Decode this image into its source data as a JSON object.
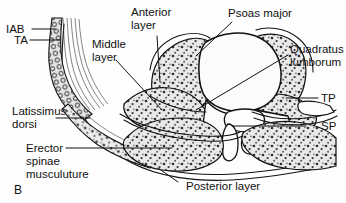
{
  "figure": {
    "panel_letter": "B",
    "caption_type": "anatomical-cross-section",
    "colors": {
      "background": "#fefefe",
      "outline": "#111111",
      "muscle_fill": "#e9e9e9",
      "stipple": "#2a2a2a",
      "bone_fill": "#fbfbfb",
      "leader_line": "#111111"
    }
  },
  "labels": {
    "iab": "IAB",
    "ta": "TA",
    "middle_layer": "Middle\nlayer",
    "middle_layer_l1": "Middle",
    "middle_layer_l2": "layer",
    "anterior_layer_l1": "Anterior",
    "anterior_layer_l2": "layer",
    "psoas_major": "Psoas major",
    "quadratus_l1": "Quadratus",
    "quadratus_l2": "lumborum",
    "tp": "TP",
    "sp": "SP",
    "latissimus_l1": "Latissimus",
    "latissimus_l2": "dorsi",
    "erector_l1": "Erector",
    "erector_l2": "spinae",
    "erector_l3": "musculuture",
    "posterior_layer": "Posterior layer"
  },
  "structures": [
    {
      "key": "iab",
      "name": "internal abdominal oblique",
      "abbrev": "IAB"
    },
    {
      "key": "ta",
      "name": "transversus abdominis",
      "abbrev": "TA"
    },
    {
      "key": "anterior_layer",
      "name": "Anterior layer",
      "abbrev": ""
    },
    {
      "key": "middle_layer",
      "name": "Middle layer",
      "abbrev": ""
    },
    {
      "key": "posterior_layer",
      "name": "Posterior layer",
      "abbrev": ""
    },
    {
      "key": "psoas_major",
      "name": "Psoas major",
      "abbrev": ""
    },
    {
      "key": "quadratus",
      "name": "Quadratus lumborum",
      "abbrev": ""
    },
    {
      "key": "tp",
      "name": "transverse process",
      "abbrev": "TP"
    },
    {
      "key": "sp",
      "name": "spinous process",
      "abbrev": "SP"
    },
    {
      "key": "latissimus",
      "name": "Latissimus dorsi",
      "abbrev": ""
    },
    {
      "key": "erector",
      "name": "Erector spinae musculuture",
      "abbrev": ""
    }
  ]
}
